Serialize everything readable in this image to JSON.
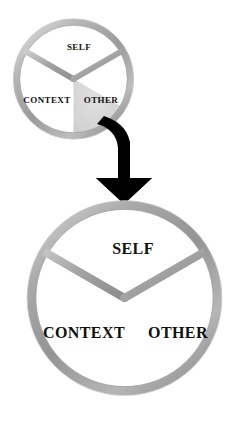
{
  "diagram": {
    "background_color": "#ffffff",
    "ring_color": "#9c9c9c",
    "ring_highlight_color": "#d8d8d8",
    "ring_shadow_color": "#7a7a7a",
    "sector_fill_color": "#ffffff",
    "sector_shaded_color": "#d5d5d5",
    "label_color": "#111111",
    "arrow_color": "#000000"
  },
  "top_circle": {
    "name": "small-triad-circle",
    "center_x": 73.5,
    "center_y": 79,
    "radius": 60.5,
    "ring_width": 7,
    "sectors": [
      {
        "id": "self",
        "label": "SELF",
        "shaded": false,
        "label_x": 79,
        "label_y": 48,
        "font_size": 9
      },
      {
        "id": "context",
        "label": "CONTEXT",
        "shaded": false,
        "label_x": 47,
        "label_y": 101,
        "font_size": 9
      },
      {
        "id": "other",
        "label": "OTHER",
        "shaded": true,
        "label_x": 101,
        "label_y": 101,
        "font_size": 9
      }
    ]
  },
  "arrow": {
    "name": "transition-arrow",
    "label": "",
    "direction": "down",
    "style": "curved-block-arrow"
  },
  "bottom_circle": {
    "name": "large-triad-circle",
    "center_x": 124.5,
    "center_y": 298,
    "radius": 97.5,
    "ring_width": 9,
    "sectors": [
      {
        "id": "self",
        "label": "SELF",
        "shaded": false,
        "label_x": 133,
        "label_y": 250,
        "font_size": 16
      },
      {
        "id": "context",
        "label": "CONTEXT",
        "shaded": false,
        "label_x": 84,
        "label_y": 334,
        "font_size": 16
      },
      {
        "id": "other",
        "label": "OTHER",
        "shaded": false,
        "label_x": 178,
        "label_y": 334,
        "font_size": 16
      }
    ]
  }
}
